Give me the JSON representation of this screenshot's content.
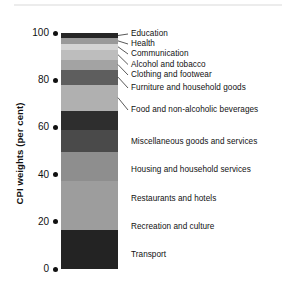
{
  "chart_data": {
    "type": "bar",
    "subtype": "stacked-bar-100",
    "title": "",
    "xlabel": "",
    "ylabel": "CPI weights (per cent)",
    "ylim": [
      0,
      100
    ],
    "yticks": [
      0,
      20,
      40,
      60,
      80,
      100
    ],
    "ytick_labels": [
      "0",
      "20",
      "40",
      "60",
      "80",
      "100"
    ],
    "grid": false,
    "legend": "right-labels-with-leader-lines",
    "categories": [
      "Education",
      "Health",
      "Communication",
      "Alcohol and tobacco",
      "Clothing and footwear",
      "Furniture and household goods",
      "Food and non-alcoholic beverages",
      "Miscellaneous goods and services",
      "Housing and household services",
      "Restaurants and hotels",
      "Recreation and culture",
      "Transport"
    ],
    "values": [
      2.1,
      2.5,
      2.5,
      4.2,
      4.2,
      6.4,
      11.0,
      8.1,
      9.3,
      12.3,
      20.7,
      16.7
    ],
    "cumulative_top": [
      100.0,
      97.9,
      95.4,
      92.9,
      88.7,
      84.5,
      78.1,
      67.1,
      59.0,
      49.7,
      37.4,
      16.7
    ],
    "cumulative_bottom": [
      97.9,
      95.4,
      92.9,
      88.7,
      84.5,
      78.1,
      67.1,
      59.0,
      49.7,
      37.4,
      16.7,
      0.0
    ],
    "segment_colors": [
      "#262626",
      "#9a9a9a",
      "#d4d4d4",
      "#bdbdbd",
      "#a3a3a3",
      "#5e5e5e",
      "#b0b0b0",
      "#2e2e2e",
      "#4a4a4a",
      "#8e8e8e",
      "#9d9d9d",
      "#232323"
    ]
  },
  "axis": {
    "y_title": "CPI weights (per cent)",
    "ticks": [
      {
        "label": "100",
        "value": 100
      },
      {
        "label": "80",
        "value": 80
      },
      {
        "label": "60",
        "value": 60
      },
      {
        "label": "40",
        "value": 40
      },
      {
        "label": "20",
        "value": 20
      },
      {
        "label": "0",
        "value": 0
      }
    ]
  },
  "labels": [
    {
      "text": "Education",
      "leader": true
    },
    {
      "text": "Health",
      "leader": true
    },
    {
      "text": "Communication",
      "leader": true
    },
    {
      "text": "Alcohol and tobacco",
      "leader": true
    },
    {
      "text": "Clothing and footwear",
      "leader": true
    },
    {
      "text": "Furniture and household goods",
      "leader": true
    },
    {
      "text": "Food and non-alcoholic beverages",
      "leader": true
    },
    {
      "text": "Miscellaneous goods and services",
      "leader": false
    },
    {
      "text": "Housing and household services",
      "leader": false
    },
    {
      "text": "Restaurants and hotels",
      "leader": false
    },
    {
      "text": "Recreation and culture",
      "leader": false
    },
    {
      "text": "Transport",
      "leader": false
    }
  ],
  "colors": {
    "text": "#111111",
    "rule": "#ececec",
    "background": "#ffffff"
  }
}
